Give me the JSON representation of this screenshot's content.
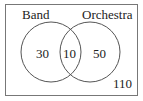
{
  "diagram": {
    "type": "venn",
    "sets": [
      {
        "label": "Band"
      },
      {
        "label": "Orchestra"
      }
    ],
    "regions": {
      "band_only": "30",
      "both": "10",
      "orchestra_only": "50",
      "neither": "110"
    },
    "colors": {
      "stroke": "#555555",
      "text": "#222222",
      "background": "#ffffff"
    }
  }
}
